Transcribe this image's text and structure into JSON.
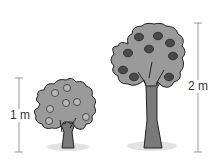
{
  "diagram": {
    "small_tree": {
      "height_label": "1 m",
      "fruit_count": 7,
      "fruit_color": "#b8b8b8",
      "canopy_color": "#9a9a9a"
    },
    "big_tree": {
      "height_label": "2 m",
      "fruit_count": 9,
      "fruit_color": "#4a4a4a",
      "canopy_color": "#9a9a9a"
    },
    "colors": {
      "outline": "#222222",
      "trunk": "#7a7a7a",
      "shadow": "#e2e2e2",
      "measure_line": "#999999"
    }
  }
}
